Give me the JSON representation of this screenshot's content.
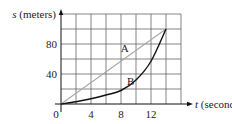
{
  "chart_data": {
    "type": "line",
    "title": "",
    "xlabel": "t (seconds)",
    "ylabel": "s (meters)",
    "xlabel_var": "t",
    "xlabel_unit": "(seconds)",
    "ylabel_var": "s",
    "ylabel_unit": "(meters)",
    "xlim": [
      0,
      16
    ],
    "ylim": [
      0,
      120
    ],
    "x_ticks": [
      0,
      4,
      8,
      12
    ],
    "y_ticks": [
      40,
      80
    ],
    "x_tick_labels": [
      "0",
      "4",
      "8",
      "12"
    ],
    "y_tick_labels": [
      "40",
      "80"
    ],
    "grid": true,
    "grid_step_x": 2,
    "grid_step_y": 20,
    "legend": "inline labels",
    "series": [
      {
        "name": "A",
        "style": "straight line, light gray",
        "color": "#a8a8a8",
        "x": [
          0,
          14
        ],
        "values": [
          0,
          100
        ]
      },
      {
        "name": "B",
        "style": "curve, black",
        "color": "#111111",
        "x": [
          0,
          2,
          4,
          6,
          8,
          10,
          12,
          14
        ],
        "values": [
          0,
          3,
          7,
          12,
          18,
          32,
          57,
          100
        ]
      }
    ],
    "annotations": [
      {
        "text": "A",
        "x": 8.5,
        "y": 70
      },
      {
        "text": "B",
        "x": 9.3,
        "y": 25
      }
    ]
  }
}
